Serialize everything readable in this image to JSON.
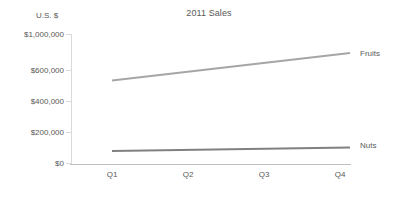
{
  "chart_data": {
    "type": "line",
    "title": "2011 Sales",
    "xlabel": "",
    "ylabel": "U.S. $",
    "categories": [
      "Q1",
      "Q2",
      "Q3",
      "Q4"
    ],
    "series": [
      {
        "name": "Fruits",
        "values": [
          510000,
          630000,
          745000,
          860000
        ],
        "color": "#a6a6a6"
      },
      {
        "name": "Nuts",
        "values": [
          75000,
          83000,
          91000,
          100000
        ],
        "color": "#808080"
      }
    ],
    "ytick_labels": [
      "$1,000,000",
      "$600,000",
      "$400,000",
      "$200,000",
      "$0"
    ],
    "ytick_values": [
      1000000,
      600000,
      400000,
      200000,
      0
    ],
    "ytick_note": "axis is non-uniform: the $800,000 tick is omitted",
    "ylim": [
      0,
      1000000
    ],
    "grid": false,
    "legend": "inline-end-of-line"
  },
  "axis": {
    "y_title": "U.S. $",
    "ticks": [
      {
        "label": "$1,000,000",
        "y": 34
      },
      {
        "label": "$600,000",
        "y": 70
      },
      {
        "label": "$400,000",
        "y": 101
      },
      {
        "label": "$200,000",
        "y": 132
      },
      {
        "label": "$0",
        "y": 163
      }
    ],
    "x_ticks": [
      {
        "label": "Q1",
        "x": 112
      },
      {
        "label": "Q2",
        "x": 188
      },
      {
        "label": "Q3",
        "x": 264
      },
      {
        "label": "Q4",
        "x": 340
      }
    ]
  },
  "series_geometry": [
    {
      "name": "Fruits",
      "color": "#a6a6a6",
      "x1": 112,
      "y1": 80.5,
      "x2": 350,
      "y2": 53.0,
      "label_x": 360,
      "label_y": 53
    },
    {
      "name": "Nuts",
      "color": "#808080",
      "x1": 112,
      "y1": 151.0,
      "x2": 350,
      "y2": 147.5,
      "label_x": 360,
      "label_y": 145
    }
  ]
}
